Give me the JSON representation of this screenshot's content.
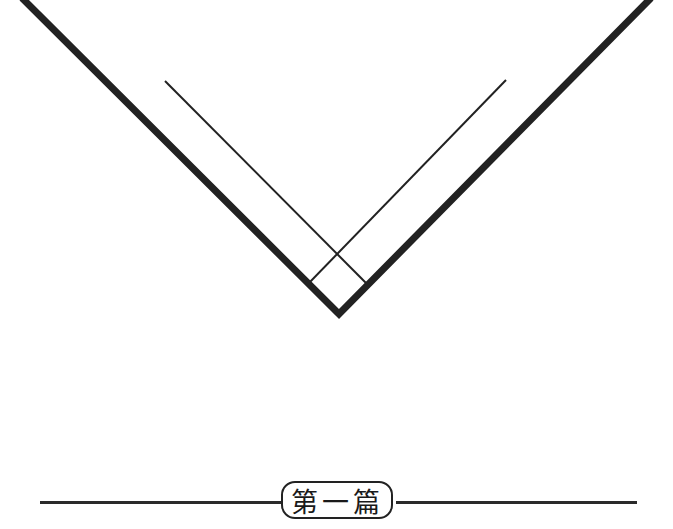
{
  "page": {
    "part_label": "第一篇"
  },
  "graphic": {
    "type": "chevron-v",
    "stroke_color": "#222222",
    "outer_v": {
      "left_top": [
        22,
        0
      ],
      "apex": [
        339,
        316
      ],
      "right_top": [
        651,
        0
      ],
      "stroke_width": 7
    },
    "inner_lines": [
      {
        "from": [
          165,
          81
        ],
        "to": [
          366,
          283
        ],
        "stroke_width": 2
      },
      {
        "from": [
          506,
          80
        ],
        "to": [
          309,
          283
        ],
        "stroke_width": 2
      }
    ]
  }
}
